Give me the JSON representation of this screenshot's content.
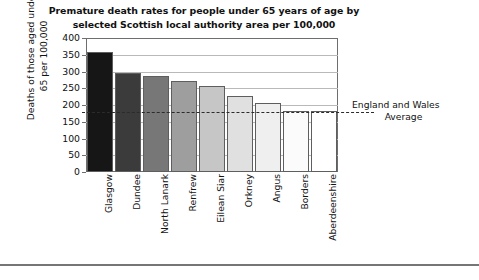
{
  "chart_data": {
    "type": "bar",
    "title": "Premature death rates for people under 65 years of age by selected Scottish local authority area per 100,000",
    "title_lines": [
      "Premature death rates for people under 65 years of age by",
      "selected Scottish local authority area per 100,000"
    ],
    "xlabel": "",
    "ylabel": "Deaths of those aged under 65 per 100,000",
    "ylabel_lines": [
      "Deaths of those aged under",
      "65 per 100,000"
    ],
    "categories": [
      "Glasgow",
      "Dundee",
      "North Lanark",
      "Renfrew",
      "Eilean Siar",
      "Orkney",
      "Angus",
      "Borders",
      "Aberdeenshire"
    ],
    "values": [
      358,
      297,
      287,
      271,
      256,
      226,
      205,
      182,
      182
    ],
    "bar_colors": [
      "#161616",
      "#3b3b3b",
      "#777777",
      "#9e9e9e",
      "#c6c6c6",
      "#e0e0e0",
      "#efefef",
      "#fbfbfb",
      "#ffffff"
    ],
    "ylim": [
      0,
      400
    ],
    "ytick_step": 50,
    "ytick_labels": [
      "0",
      "50",
      "100",
      "150",
      "200",
      "250",
      "300",
      "350",
      "400"
    ],
    "grid": true,
    "legend": "none",
    "annotations": [
      {
        "name": "england-and-wales-average",
        "text": "England and Wales Average",
        "lines": [
          "England and Wales",
          "Average"
        ],
        "value": 180,
        "style": "dashed-horizontal-line"
      }
    ]
  }
}
